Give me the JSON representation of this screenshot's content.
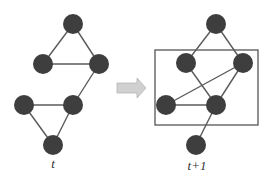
{
  "diagram": {
    "title": "",
    "colors": {
      "node": "#3e3e3e",
      "edge": "#5a5a5a",
      "arrow": "#c8c8c8",
      "box": "#555555"
    },
    "graphs": [
      {
        "label": "t",
        "nodes": [
          {
            "id": "a",
            "x": 73,
            "y": 24
          },
          {
            "id": "b",
            "x": 43,
            "y": 64
          },
          {
            "id": "c",
            "x": 99,
            "y": 64
          },
          {
            "id": "d",
            "x": 24,
            "y": 105
          },
          {
            "id": "e",
            "x": 73,
            "y": 105
          },
          {
            "id": "f",
            "x": 53,
            "y": 145
          }
        ],
        "edges": [
          [
            "a",
            "b"
          ],
          [
            "a",
            "c"
          ],
          [
            "b",
            "c"
          ],
          [
            "c",
            "e"
          ],
          [
            "d",
            "e"
          ],
          [
            "d",
            "f"
          ],
          [
            "e",
            "f"
          ]
        ]
      },
      {
        "label": "t+1",
        "nodes": [
          {
            "id": "a",
            "x": 216,
            "y": 24
          },
          {
            "id": "b",
            "x": 186,
            "y": 63
          },
          {
            "id": "c",
            "x": 243,
            "y": 63
          },
          {
            "id": "d",
            "x": 166,
            "y": 105
          },
          {
            "id": "e",
            "x": 216,
            "y": 105
          },
          {
            "id": "f",
            "x": 196,
            "y": 145
          }
        ],
        "edges": [
          [
            "a",
            "b"
          ],
          [
            "a",
            "c"
          ],
          [
            "b",
            "e"
          ],
          [
            "c",
            "d"
          ],
          [
            "c",
            "e"
          ],
          [
            "d",
            "e"
          ],
          [
            "e",
            "f"
          ]
        ],
        "highlight_box": {
          "x": 155,
          "y": 50,
          "width": 103,
          "height": 75
        }
      }
    ],
    "arrow": {
      "direction": "right",
      "from": "t",
      "to": "t+1"
    }
  }
}
